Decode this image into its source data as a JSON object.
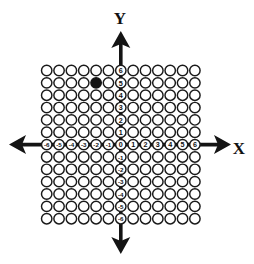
{
  "figure": {
    "title": "",
    "background_color": "#ffffff",
    "ink_color": "#141414",
    "axis_label_x": "X",
    "axis_label_y": "Y"
  },
  "chart_data": {
    "type": "scatter",
    "title": "",
    "xlabel": "X",
    "ylabel": "Y",
    "xlim": [
      -6,
      6
    ],
    "ylim": [
      -6,
      6
    ],
    "grid": true,
    "grid_style": "lattice of open circles at every integer lattice point",
    "legend": "none",
    "x_tick_labels": [
      "-6",
      "-5",
      "-4",
      "-3",
      "-2",
      "-1",
      "0",
      "1",
      "2",
      "3",
      "4",
      "5",
      "6"
    ],
    "y_tick_labels": [
      "6",
      "5",
      "4",
      "3",
      "2",
      "1",
      "0",
      "-1",
      "-2",
      "-3",
      "-4",
      "-5",
      "-6"
    ],
    "x_ticks": [
      -6,
      -5,
      -4,
      -3,
      -2,
      -1,
      0,
      1,
      2,
      3,
      4,
      5,
      6
    ],
    "y_ticks": [
      6,
      5,
      4,
      3,
      2,
      1,
      0,
      -1,
      -2,
      -3,
      -4,
      -5,
      -6
    ],
    "series": [
      {
        "name": "plotted point",
        "marker": "filled-circle",
        "color": "#141414",
        "points": [
          {
            "x": -2,
            "y": 5
          }
        ]
      }
    ],
    "annotations": []
  },
  "geometry": {
    "grid_origin_x": 120.8,
    "grid_origin_y": 144.6,
    "cell_pitch": 12.35,
    "circle_radius": 5.2,
    "min_index": -6,
    "max_index": 6
  },
  "arrows": {
    "x_positive_tip": 231,
    "x_negative_tip": 9,
    "y_positive_tip": 31,
    "y_negative_tip": 254
  },
  "labels": {
    "x_axis_text_x": 239,
    "x_axis_text_y": 150,
    "y_axis_text_x": 120,
    "y_axis_text_y": 20
  }
}
